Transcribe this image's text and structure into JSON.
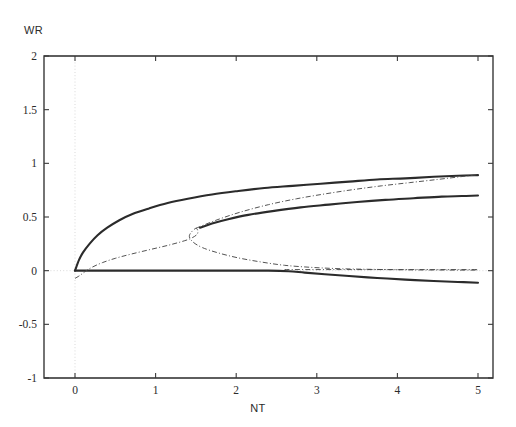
{
  "figure": {
    "axis_titles": {
      "y": "WR",
      "x": "NT"
    },
    "x_axis": {
      "label": "NT",
      "min": 0,
      "max": 5,
      "ticks": [
        "0",
        "1",
        "2",
        "3",
        "4",
        "5"
      ],
      "tick_values": [
        0,
        1,
        2,
        3,
        4,
        5
      ]
    },
    "y_axis": {
      "label": "WR",
      "min": -1,
      "max": 2,
      "ticks": [
        "2",
        "1.5",
        "1",
        "0.5",
        "0",
        "-0.5",
        "-1"
      ],
      "tick_values": [
        2,
        1.5,
        1,
        0.5,
        0,
        -0.5,
        -1
      ]
    }
  },
  "chart_data": {
    "type": "line",
    "title": "",
    "xlabel": "NT",
    "ylabel": "WR",
    "xlim": [
      0,
      5
    ],
    "ylim": [
      -1,
      2
    ],
    "grid": true,
    "grid_style": "dotted",
    "legend": "none",
    "series": [
      {
        "name": "upper-stable-branch",
        "style": "solid-thick",
        "color": "#2b2b2b",
        "points": [
          [
            0.0,
            0.0
          ],
          [
            0.05,
            0.1
          ],
          [
            0.1,
            0.17
          ],
          [
            0.18,
            0.25
          ],
          [
            0.28,
            0.33
          ],
          [
            0.4,
            0.4
          ],
          [
            0.55,
            0.47
          ],
          [
            0.72,
            0.53
          ],
          [
            0.92,
            0.58
          ],
          [
            1.15,
            0.63
          ],
          [
            1.4,
            0.67
          ],
          [
            1.7,
            0.71
          ],
          [
            2.0,
            0.74
          ],
          [
            2.35,
            0.77
          ],
          [
            2.7,
            0.79
          ],
          [
            3.05,
            0.81
          ],
          [
            3.4,
            0.83
          ],
          [
            3.75,
            0.85
          ],
          [
            4.1,
            0.86
          ],
          [
            4.45,
            0.875
          ],
          [
            4.75,
            0.885
          ],
          [
            5.0,
            0.89
          ]
        ]
      },
      {
        "name": "middle-branch",
        "style": "solid-thick",
        "color": "#2b2b2b",
        "points": [
          [
            1.55,
            0.4
          ],
          [
            1.7,
            0.44
          ],
          [
            1.9,
            0.48
          ],
          [
            2.15,
            0.52
          ],
          [
            2.45,
            0.555
          ],
          [
            2.8,
            0.59
          ],
          [
            3.15,
            0.615
          ],
          [
            3.5,
            0.64
          ],
          [
            3.85,
            0.66
          ],
          [
            4.2,
            0.675
          ],
          [
            4.55,
            0.69
          ],
          [
            4.8,
            0.695
          ],
          [
            5.0,
            0.7
          ]
        ]
      },
      {
        "name": "lower-branch",
        "style": "solid-thick",
        "color": "#2b2b2b",
        "points": [
          [
            0.0,
            0.0
          ],
          [
            0.5,
            0.0
          ],
          [
            1.0,
            0.0
          ],
          [
            1.5,
            0.0
          ],
          [
            2.0,
            0.0
          ],
          [
            2.4,
            0.0
          ],
          [
            2.65,
            -0.005
          ],
          [
            2.85,
            -0.018
          ],
          [
            3.1,
            -0.033
          ],
          [
            3.4,
            -0.05
          ],
          [
            3.75,
            -0.068
          ],
          [
            4.1,
            -0.083
          ],
          [
            4.45,
            -0.096
          ],
          [
            4.75,
            -0.105
          ],
          [
            5.0,
            -0.112
          ]
        ]
      },
      {
        "name": "unstable-fold-curve",
        "style": "dash-dot-thin",
        "color": "#4a4a4a",
        "points": [
          [
            0.0,
            -0.072
          ],
          [
            0.06,
            -0.045
          ],
          [
            0.1,
            -0.022
          ],
          [
            0.14,
            0.0
          ],
          [
            0.22,
            0.035
          ],
          [
            0.34,
            0.075
          ],
          [
            0.5,
            0.115
          ],
          [
            0.7,
            0.155
          ],
          [
            0.95,
            0.2
          ],
          [
            1.2,
            0.245
          ],
          [
            1.42,
            0.295
          ],
          [
            1.52,
            0.345
          ],
          [
            1.5,
            0.395
          ],
          [
            1.42,
            0.33
          ],
          [
            1.46,
            0.27
          ],
          [
            1.58,
            0.215
          ],
          [
            1.78,
            0.165
          ],
          [
            2.02,
            0.12
          ],
          [
            2.3,
            0.082
          ],
          [
            2.6,
            0.05
          ],
          [
            2.95,
            0.03
          ],
          [
            3.3,
            0.018
          ],
          [
            3.7,
            0.012
          ],
          [
            4.1,
            0.008
          ],
          [
            4.55,
            0.006
          ],
          [
            5.0,
            0.005
          ]
        ]
      },
      {
        "name": "upper-asymptote-dashdot",
        "style": "dash-dot-thin",
        "color": "#4a4a4a",
        "points": [
          [
            1.5,
            0.395
          ],
          [
            1.75,
            0.47
          ],
          [
            2.05,
            0.545
          ],
          [
            2.4,
            0.615
          ],
          [
            2.75,
            0.67
          ],
          [
            3.1,
            0.715
          ],
          [
            3.45,
            0.755
          ],
          [
            3.8,
            0.79
          ],
          [
            4.15,
            0.82
          ],
          [
            4.5,
            0.85
          ],
          [
            4.78,
            0.875
          ],
          [
            5.0,
            0.895
          ]
        ]
      },
      {
        "name": "zero-axis-dashdot",
        "style": "dash-dot-thin",
        "color": "#4a4a4a",
        "points": [
          [
            2.6,
            0.01
          ],
          [
            3.2,
            0.01
          ],
          [
            4.0,
            0.01
          ],
          [
            5.0,
            0.01
          ]
        ]
      }
    ],
    "annotations": [
      {
        "name": "fold-point",
        "x": 1.52,
        "y": 0.4,
        "text": ""
      },
      {
        "name": "branch-point",
        "x": 2.62,
        "y": 0.0,
        "text": ""
      },
      {
        "name": "origin-branch-point",
        "x": 0.0,
        "y": 0.0,
        "text": ""
      }
    ]
  }
}
